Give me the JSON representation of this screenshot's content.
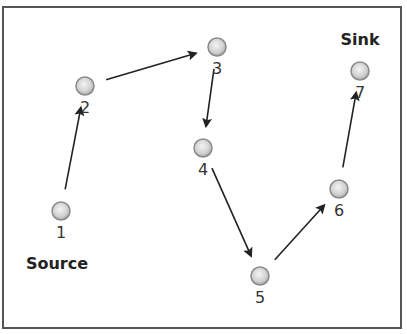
{
  "diagram": {
    "type": "directed-path-graph",
    "nodes": [
      {
        "id": "1",
        "label": "1",
        "x": 61,
        "y": 211,
        "role": "Source"
      },
      {
        "id": "2",
        "label": "2",
        "x": 85,
        "y": 86
      },
      {
        "id": "3",
        "label": "3",
        "x": 217,
        "y": 47
      },
      {
        "id": "4",
        "label": "4",
        "x": 203,
        "y": 148
      },
      {
        "id": "5",
        "label": "5",
        "x": 260,
        "y": 276
      },
      {
        "id": "6",
        "label": "6",
        "x": 339,
        "y": 189
      },
      {
        "id": "7",
        "label": "7",
        "x": 360,
        "y": 71,
        "role": "Sink"
      }
    ],
    "edges": [
      {
        "from": "1",
        "to": "2"
      },
      {
        "from": "2",
        "to": "3"
      },
      {
        "from": "3",
        "to": "4"
      },
      {
        "from": "4",
        "to": "5"
      },
      {
        "from": "5",
        "to": "6"
      },
      {
        "from": "6",
        "to": "7"
      }
    ],
    "source_label": "Source",
    "sink_label": "Sink",
    "colors": {
      "node_fill": "#d9d9d9",
      "node_stroke": "#8a8a8a",
      "edge": "#222222",
      "border": "#555555"
    }
  }
}
